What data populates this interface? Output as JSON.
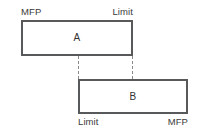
{
  "diagram": {
    "background_color": "#ffffff",
    "border_color": "#58595b",
    "text_color": "#3a3a3a",
    "connector_color": "#8a8a8a",
    "blocks": [
      {
        "id": "a",
        "label": "A",
        "left_edge_label": "MFP",
        "right_edge_label": "Limit",
        "labels_position": "top"
      },
      {
        "id": "b",
        "label": "B",
        "left_edge_label": "Limit",
        "right_edge_label": "MFP",
        "labels_position": "bottom"
      }
    ],
    "connectors": [
      {
        "id": "left",
        "style": "dashed",
        "from": "block-a-bottom",
        "to": "block-b-top"
      },
      {
        "id": "right",
        "style": "dashed",
        "from": "block-a-bottom",
        "to": "block-b-top"
      }
    ]
  }
}
